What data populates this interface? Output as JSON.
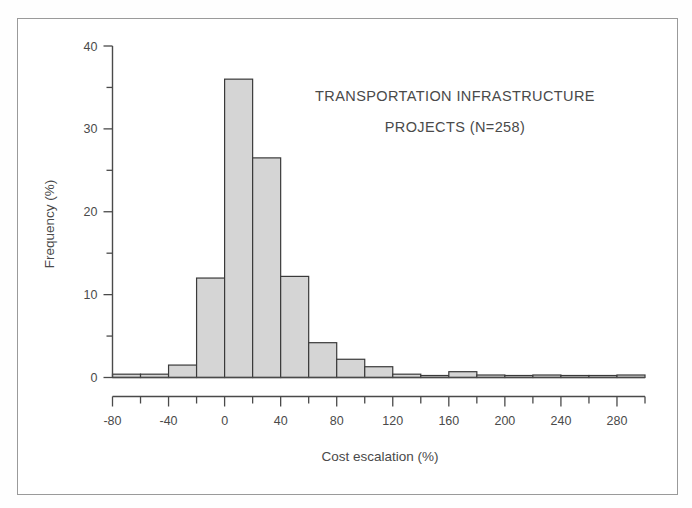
{
  "figure": {
    "background_color": "#ffffff",
    "frame_color": "#9a9a9a",
    "ink_color": "#4a4a4a"
  },
  "chart_data": {
    "type": "bar",
    "subtype": "histogram",
    "title": "",
    "annotation_lines": [
      "TRANSPORTATION INFRASTRUCTURE",
      "PROJECTS (N=258)"
    ],
    "sample_size": 258,
    "xlabel": "Cost escalation (%)",
    "ylabel": "Frequency (%)",
    "xlim": [
      -80,
      300
    ],
    "ylim": [
      0,
      40
    ],
    "x_major_ticks": [
      -80,
      -40,
      0,
      40,
      80,
      120,
      160,
      200,
      240,
      280
    ],
    "x_major_tick_labels": [
      "-80",
      "-40",
      "0",
      "40",
      "80",
      "120",
      "160",
      "200",
      "240",
      "280"
    ],
    "x_minor_tick_step": 20,
    "y_major_ticks": [
      0,
      10,
      20,
      30,
      40
    ],
    "y_major_tick_labels": [
      "0",
      "10",
      "20",
      "30",
      "40"
    ],
    "y_minor_tick_step": 5,
    "grid": false,
    "legend": false,
    "bin_width": 20,
    "bin_edges": [
      -80,
      -60,
      -40,
      -20,
      0,
      20,
      40,
      60,
      80,
      100,
      120,
      140,
      160,
      180,
      200,
      220,
      240,
      260,
      280,
      300
    ],
    "categories": [
      "-80 to -60",
      "-60 to -40",
      "-40 to -20",
      "-20 to 0",
      "0 to 20",
      "20 to 40",
      "40 to 60",
      "60 to 80",
      "80 to 100",
      "100 to 120",
      "120 to 140",
      "140 to 160",
      "160 to 180",
      "180 to 200",
      "200 to 220",
      "220 to 240",
      "240 to 260",
      "260 to 280",
      "280 to 300"
    ],
    "values": [
      0.4,
      0.4,
      1.5,
      12.0,
      36.0,
      26.5,
      12.2,
      4.2,
      2.2,
      1.3,
      0.4,
      0.0,
      0.7,
      0.3,
      0.0,
      0.3,
      0.0,
      0.0,
      0.3
    ],
    "bar_fill_color": "#d5d5d5",
    "bar_edge_color": "#3a3a3a"
  }
}
